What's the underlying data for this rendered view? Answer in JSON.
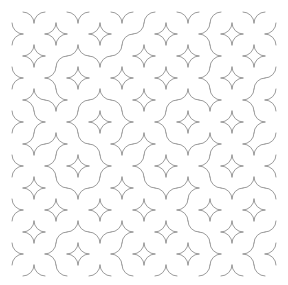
{
  "artwork": {
    "title": "Truchet Tile Pattern",
    "kind": "generative-pattern",
    "canvas": {
      "width": 288,
      "height": 285,
      "background_color": "#ffffff"
    },
    "stroke": {
      "color": "#8f8f8f",
      "width": 0.9,
      "linecap": "round",
      "fill": "none"
    },
    "grid": {
      "origin_x": 12,
      "origin_y": 12,
      "cell_size": 22,
      "columns": 12,
      "rows": 12,
      "arc_radius": 11,
      "tile_variants": [
        "A",
        "B"
      ],
      "variant_a_description": "quarter arcs centered at top-left and bottom-right corners",
      "variant_b_description": "quarter arcs centered at top-right and bottom-left corners"
    },
    "tiles": [
      [
        "B",
        "A",
        "B",
        "A",
        "B",
        "A",
        "A",
        "B",
        "A",
        "A",
        "B",
        "A"
      ],
      [
        "A",
        "B",
        "A",
        "B",
        "A",
        "A",
        "B",
        "A",
        "B",
        "B",
        "A",
        "B"
      ],
      [
        "B",
        "A",
        "A",
        "B",
        "A",
        "B",
        "A",
        "B",
        "A",
        "A",
        "B",
        "A"
      ],
      [
        "A",
        "B",
        "B",
        "A",
        "B",
        "A",
        "B",
        "A",
        "B",
        "B",
        "A",
        "A"
      ],
      [
        "B",
        "B",
        "A",
        "A",
        "B",
        "B",
        "A",
        "A",
        "B",
        "A",
        "B",
        "B"
      ],
      [
        "A",
        "A",
        "B",
        "B",
        "A",
        "A",
        "B",
        "B",
        "A",
        "B",
        "A",
        "A"
      ],
      [
        "B",
        "A",
        "A",
        "B",
        "B",
        "A",
        "A",
        "B",
        "A",
        "A",
        "B",
        "A"
      ],
      [
        "A",
        "B",
        "B",
        "A",
        "A",
        "B",
        "B",
        "A",
        "B",
        "B",
        "A",
        "B"
      ],
      [
        "B",
        "A",
        "B",
        "A",
        "B",
        "A",
        "B",
        "A",
        "A",
        "B",
        "A",
        "B"
      ],
      [
        "A",
        "B",
        "A",
        "B",
        "A",
        "B",
        "A",
        "B",
        "B",
        "A",
        "B",
        "A"
      ],
      [
        "B",
        "A",
        "A",
        "B",
        "A",
        "A",
        "B",
        "A",
        "B",
        "B",
        "A",
        "A"
      ],
      [
        "A",
        "B",
        "B",
        "A",
        "B",
        "B",
        "A",
        "B",
        "A",
        "A",
        "B",
        "B"
      ]
    ]
  }
}
